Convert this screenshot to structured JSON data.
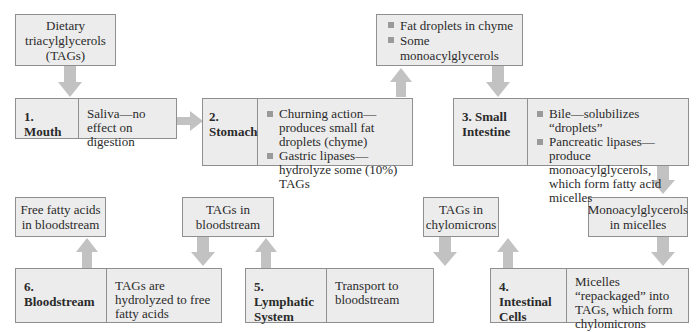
{
  "diagram": {
    "colors": {
      "box_fill": "#ececec",
      "border": "#8f8f8f",
      "arrow": "#c4c4c4",
      "bullet": "#9a9a9a"
    },
    "notes": {
      "dietary": "Dietary triacylglycerols (TAGs)",
      "chyme": [
        "Fat droplets in chyme",
        "Some monoacylglycerols"
      ],
      "micelles": "Monoacylglycerols in micelles",
      "chylomicrons": "TAGs in chylomicrons",
      "tags_blood": "TAGs in bloodstream",
      "ffa_blood": "Free fatty acids in bloodstream"
    },
    "stages": [
      {
        "title": "1. Mouth",
        "desc": "Saliva—no effect on digestion"
      },
      {
        "title": "2. Stomach",
        "bullets": [
          "Churning action—produces small fat droplets (chyme)",
          "Gastric lipases—hydrolyze some (10%) TAGs"
        ]
      },
      {
        "title": "3. Small Intestine",
        "bullets": [
          "Bile—solubilizes “droplets”",
          "Pancreatic lipases—produce monoacylglycerols, which form fatty acid micelles"
        ]
      },
      {
        "title": "4. Intestinal Cells",
        "desc": "Micelles “repackaged” into TAGs, which form chylomicrons"
      },
      {
        "title": "5. Lymphatic System",
        "desc": "Transport to bloodstream"
      },
      {
        "title": "6. Bloodstream",
        "desc": "TAGs are hydrolyzed to free fatty acids"
      }
    ]
  }
}
